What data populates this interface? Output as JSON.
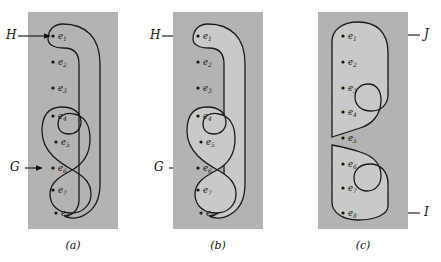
{
  "figure": {
    "background_color": "#ffffff",
    "panel_background_color": "#b3b3b3",
    "region_fill_color": "#c9c9c9",
    "curve_color": "#1a1a1a",
    "dot_color": "#15120f",
    "width": 441,
    "height": 262
  },
  "elements": [
    {
      "id": "e1",
      "base": "e",
      "sub": "1"
    },
    {
      "id": "e2",
      "base": "e",
      "sub": "2"
    },
    {
      "id": "e3",
      "base": "e",
      "sub": "3"
    },
    {
      "id": "e4",
      "base": "e",
      "sub": "4"
    },
    {
      "id": "e5",
      "base": "e",
      "sub": "5"
    },
    {
      "id": "e6",
      "base": "e",
      "sub": "6"
    },
    {
      "id": "e7",
      "base": "e",
      "sub": "7"
    },
    {
      "id": "e8",
      "base": "e",
      "sub": "8"
    }
  ],
  "panels": [
    {
      "key": "a",
      "caption": "(a)",
      "labels": [
        {
          "name": "H",
          "text": "H",
          "arrow": "right",
          "target": "e1"
        },
        {
          "name": "G",
          "text": "G",
          "arrow": "right",
          "target": "e6"
        }
      ],
      "regions": [
        {
          "name": "H",
          "members": [
            "e1"
          ],
          "shaded": false
        },
        {
          "name": "G",
          "members": [
            "e4",
            "e5",
            "e6",
            "e7",
            "e8"
          ],
          "shaded": false
        }
      ]
    },
    {
      "key": "b",
      "caption": "(b)",
      "labels": [
        {
          "name": "H",
          "text": "H",
          "arrow": "right",
          "target": "e1"
        },
        {
          "name": "G",
          "text": "G",
          "arrow": "right",
          "target": "e6"
        }
      ],
      "regions": [
        {
          "name": "H",
          "members": [
            "e1"
          ],
          "shaded": true
        },
        {
          "name": "G",
          "members": [
            "e4",
            "e5",
            "e6",
            "e7",
            "e8"
          ],
          "shaded": true
        }
      ]
    },
    {
      "key": "c",
      "caption": "(c)",
      "labels": [
        {
          "name": "J",
          "text": "J",
          "arrow": "left",
          "target": "e1"
        },
        {
          "name": "I",
          "text": "I",
          "arrow": "left",
          "target": "e8"
        }
      ],
      "regions": [
        {
          "name": "J",
          "members": [
            "e1",
            "e2",
            "e3",
            "e4",
            "e5"
          ],
          "shaded": true
        },
        {
          "name": "I",
          "members": [
            "e6",
            "e7",
            "e8"
          ],
          "shaded": true
        }
      ]
    }
  ]
}
